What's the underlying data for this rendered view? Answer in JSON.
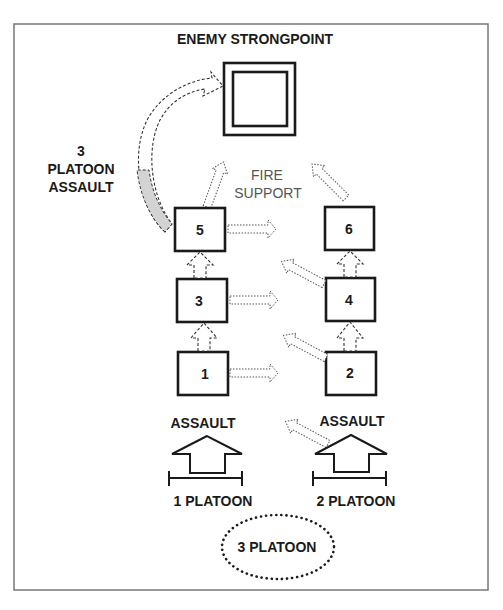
{
  "diagram": {
    "title": "ENEMY STRONGPOINT",
    "side_label": {
      "line1": "3",
      "line2": "PLATOON",
      "line3": "ASSAULT"
    },
    "fire_support": {
      "line1": "FIRE",
      "line2": "SUPPORT"
    },
    "sections": [
      {
        "id": "1",
        "label": "1"
      },
      {
        "id": "2",
        "label": "2"
      },
      {
        "id": "3",
        "label": "3"
      },
      {
        "id": "4",
        "label": "4"
      },
      {
        "id": "5",
        "label": "5"
      },
      {
        "id": "6",
        "label": "6"
      }
    ],
    "left_assault": {
      "label": "ASSAULT",
      "unit": "1 PLATOON"
    },
    "right_assault": {
      "label": "ASSAULT",
      "unit": "2 PLATOON"
    },
    "reserve": {
      "label": "3 PLATOON"
    },
    "colors": {
      "line": "#1a1a1a",
      "fill_gray": "#d3d3d3",
      "frame": "#777777"
    }
  }
}
